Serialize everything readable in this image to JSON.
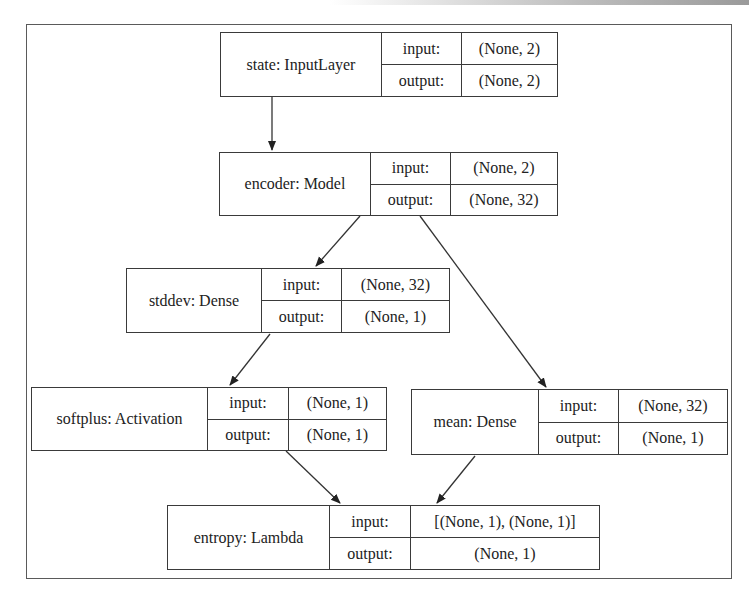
{
  "diagram": {
    "type": "keras-model-plot",
    "nodes": [
      {
        "id": "state",
        "name": "state: InputLayer",
        "input_label": "input:",
        "input_value": "(None, 2)",
        "output_label": "output:",
        "output_value": "(None, 2)"
      },
      {
        "id": "encoder",
        "name": "encoder: Model",
        "input_label": "input:",
        "input_value": "(None, 2)",
        "output_label": "output:",
        "output_value": "(None, 32)"
      },
      {
        "id": "stddev",
        "name": "stddev: Dense",
        "input_label": "input:",
        "input_value": "(None, 32)",
        "output_label": "output:",
        "output_value": "(None, 1)"
      },
      {
        "id": "softplus",
        "name": "softplus: Activation",
        "input_label": "input:",
        "input_value": "(None, 1)",
        "output_label": "output:",
        "output_value": "(None, 1)"
      },
      {
        "id": "mean",
        "name": "mean: Dense",
        "input_label": "input:",
        "input_value": "(None, 32)",
        "output_label": "output:",
        "output_value": "(None, 1)"
      },
      {
        "id": "entropy",
        "name": "entropy: Lambda",
        "input_label": "input:",
        "input_value": "[(None, 1), (None, 1)]",
        "output_label": "output:",
        "output_value": "(None, 1)"
      }
    ],
    "edges": [
      {
        "from": "state",
        "to": "encoder"
      },
      {
        "from": "encoder",
        "to": "stddev"
      },
      {
        "from": "encoder",
        "to": "mean"
      },
      {
        "from": "stddev",
        "to": "softplus"
      },
      {
        "from": "softplus",
        "to": "entropy"
      },
      {
        "from": "mean",
        "to": "entropy"
      }
    ],
    "colors": {
      "stroke": "#3a3a3a",
      "background": "#ffffff",
      "text": "#222222"
    }
  }
}
